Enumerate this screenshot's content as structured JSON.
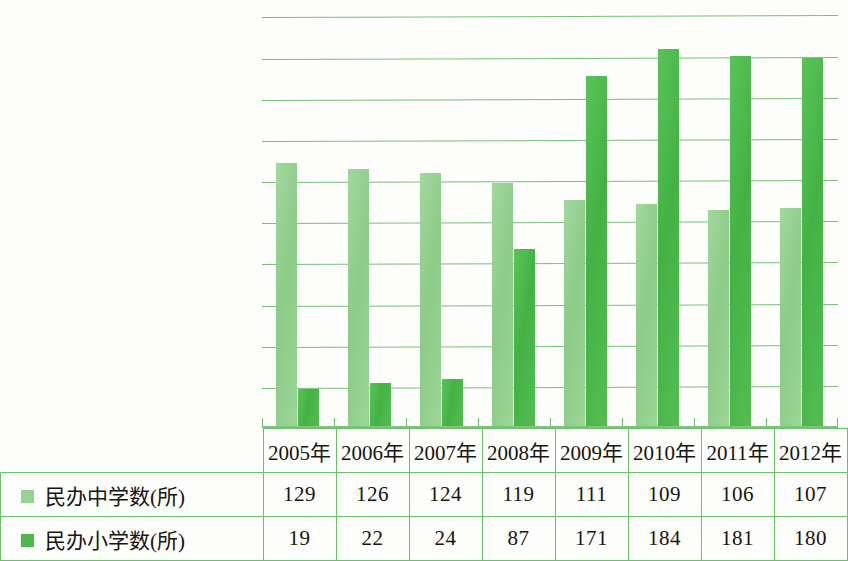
{
  "chart_data": {
    "type": "bar",
    "title": "",
    "xlabel": "",
    "ylabel": "",
    "categories": [
      "2005年",
      "2006年",
      "2007年",
      "2008年",
      "2009年",
      "2010年",
      "2011年",
      "2012年"
    ],
    "series": [
      {
        "name": "民办中学数(所)",
        "color": "#93d28f",
        "values": [
          129,
          126,
          124,
          119,
          111,
          109,
          106,
          107
        ]
      },
      {
        "name": "民办小学数(所)",
        "color": "#4cba4b",
        "values": [
          19,
          22,
          24,
          87,
          171,
          184,
          181,
          180
        ]
      }
    ],
    "ylim": [
      0,
      208
    ],
    "gridline_step": 20,
    "gridline_values": [
      20,
      40,
      60,
      80,
      100,
      120,
      140,
      160,
      180,
      200
    ],
    "grid": true,
    "legend_position": "table-left-column"
  },
  "table": {
    "year_header": [
      "2005年",
      "2006年",
      "2007年",
      "2008年",
      "2009年",
      "2010年",
      "2011年",
      "2012年"
    ],
    "rows": [
      {
        "swatch": "mid",
        "label": "民办中学数(所)",
        "values": [
          "129",
          "126",
          "124",
          "119",
          "111",
          "109",
          "106",
          "107"
        ]
      },
      {
        "swatch": "pri",
        "label": "民办小学数(所)",
        "values": [
          "19",
          "22",
          "24",
          "87",
          "171",
          "184",
          "181",
          "180"
        ]
      }
    ]
  },
  "colors": {
    "grid": "#5cb85c",
    "middle_school_bar": "#93d28f",
    "primary_school_bar": "#4cba4b",
    "table_border": "#6cc06c",
    "text": "#16150f"
  }
}
